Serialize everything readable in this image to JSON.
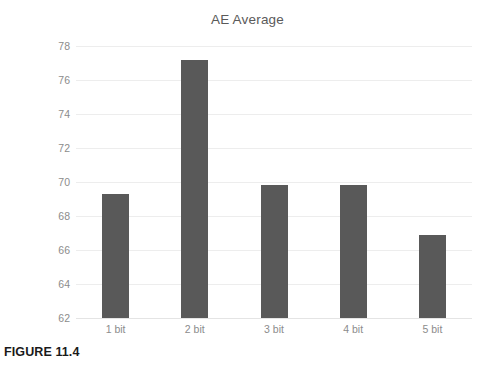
{
  "figure": {
    "caption": "FIGURE 11.4"
  },
  "chart_data": {
    "type": "bar",
    "title": "AE Average",
    "xlabel": "",
    "ylabel": "",
    "categories": [
      "1 bit",
      "2 bit",
      "3 bit",
      "4 bit",
      "5 bit"
    ],
    "values": [
      69.3,
      77.2,
      69.85,
      69.8,
      66.9
    ],
    "ylim": [
      62,
      78
    ],
    "ytick_labels": [
      "78",
      "76",
      "74",
      "72",
      "70",
      "68",
      "66",
      "64",
      "62"
    ],
    "yticks": [
      78,
      76,
      74,
      72,
      70,
      68,
      66,
      64,
      62
    ],
    "grid": true,
    "legend": false,
    "legend_position": "none",
    "bar_color": "#595959",
    "gridline_color": "#ededed",
    "title_color": "#5a5a5a",
    "tick_label_color": "#8c8c8c",
    "background_color": "#ffffff"
  }
}
